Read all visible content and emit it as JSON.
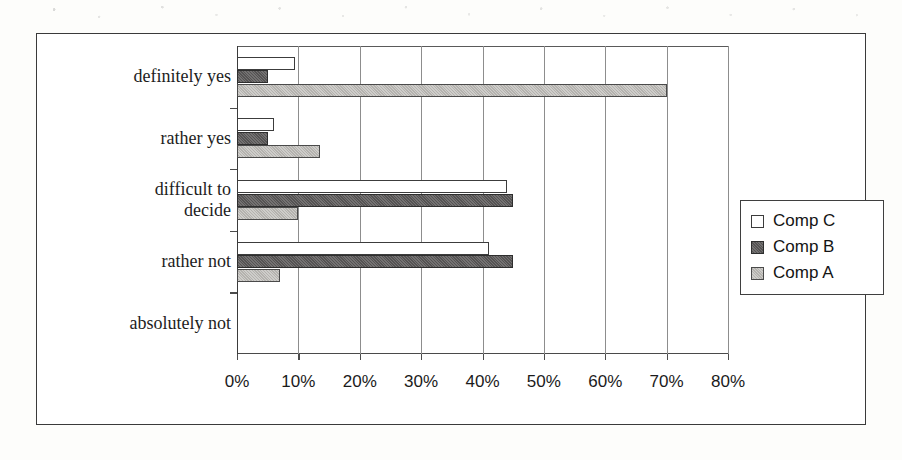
{
  "chart_data": {
    "type": "bar",
    "orientation": "horizontal",
    "title": "",
    "xlabel": "",
    "ylabel": "",
    "xlim": [
      0,
      80
    ],
    "xtick_labels": [
      "0%",
      "10%",
      "20%",
      "30%",
      "40%",
      "50%",
      "60%",
      "70%",
      "80%"
    ],
    "xticks": [
      0,
      10,
      20,
      30,
      40,
      50,
      60,
      70,
      80
    ],
    "grid": true,
    "legend_position": "right",
    "categories": [
      "definitely yes",
      "rather yes",
      "difficult to decide",
      "rather not",
      "absolutely not"
    ],
    "series": [
      {
        "name": "Comp C",
        "color": "#ffffff",
        "values": [
          9.5,
          6,
          44,
          41,
          0
        ]
      },
      {
        "name": "Comp B",
        "color": "#555353",
        "values": [
          5,
          5,
          45,
          45,
          0
        ]
      },
      {
        "name": "Comp A",
        "color": "#b4b2ae",
        "values": [
          70,
          13.5,
          10,
          7,
          0
        ]
      }
    ]
  },
  "legend": {
    "items": [
      {
        "label": "Comp C",
        "swatch": "compC"
      },
      {
        "label": "Comp B",
        "swatch": "compB"
      },
      {
        "label": "Comp A",
        "swatch": "compA"
      }
    ]
  },
  "categories": [
    {
      "lines": [
        "definitely yes"
      ]
    },
    {
      "lines": [
        "rather yes"
      ]
    },
    {
      "lines": [
        "difficult to",
        "decide"
      ]
    },
    {
      "lines": [
        "rather not"
      ]
    },
    {
      "lines": [
        "absolutely not"
      ]
    }
  ],
  "axis": {
    "ticks": [
      "0%",
      "10%",
      "20%",
      "30%",
      "40%",
      "50%",
      "60%",
      "70%",
      "80%"
    ]
  }
}
